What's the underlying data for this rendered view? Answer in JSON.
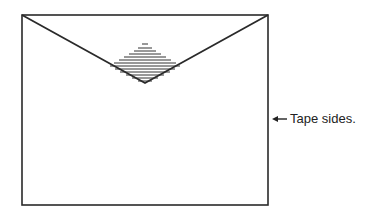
{
  "diagram": {
    "label": "Tape sides.",
    "arrow": "left-arrow",
    "stroke_color": "#2a2a2a",
    "envelope": {
      "x": 22,
      "y": 15,
      "width": 246,
      "height": 190
    },
    "flap_apex": {
      "x": 145,
      "y": 83
    }
  }
}
